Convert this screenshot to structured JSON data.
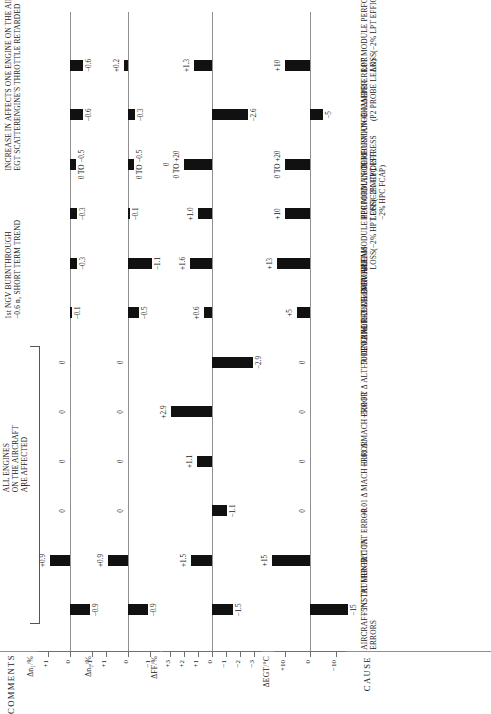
{
  "figure": {
    "comments_header": "COMMENTS",
    "cause_header": "CAUSE"
  },
  "groups": [
    {
      "title": "AIRCRAFT INSTRUMENTATION\nERRORS"
    },
    {
      "title": "ENGINE RELATED PROBLEMS"
    }
  ],
  "panels": [
    {
      "name": "egt",
      "title": "ΔEGT/°C",
      "ticks": [
        "+10",
        "0",
        "−10"
      ],
      "tickvals": [
        10,
        0,
        -10
      ],
      "lim": [
        -14,
        14
      ]
    },
    {
      "name": "ff",
      "title": "ΔFF/%",
      "ticks": [
        "+3",
        "+2",
        "+1",
        "0",
        "−1",
        "−2",
        "−3"
      ],
      "tickvals": [
        3,
        2,
        1,
        0,
        -1,
        -2,
        -3
      ],
      "lim": [
        -3.6,
        3.6
      ]
    },
    {
      "name": "n2",
      "title": "Δn₂/%",
      "ticks": [
        "+1",
        "0",
        "−1"
      ],
      "tickvals": [
        1,
        0,
        -1
      ],
      "lim": [
        -1.45,
        1.45
      ]
    },
    {
      "name": "n1",
      "title": "Δn₁/%",
      "ticks": [
        "+1",
        "0",
        "−1"
      ],
      "tickvals": [
        1,
        0,
        -1
      ],
      "lim": [
        -1.45,
        1.45
      ]
    }
  ],
  "rows": [
    {
      "cause": "+5°C  TAT ERROR",
      "group": 0,
      "egt": {
        "label": "−15",
        "value": -15
      },
      "ff": {
        "label": "−1.5",
        "value": -1.5
      },
      "n2": {
        "label": "−0.9",
        "value": -0.9
      },
      "n1": {
        "label": "−0.9",
        "value": -0.9
      },
      "comment": ""
    },
    {
      "cause": "−5°C  TAT ERROR",
      "group": 0,
      "egt": {
        "label": "+15",
        "value": 15
      },
      "ff": {
        "label": "+1.5",
        "value": 1.5
      },
      "n2": {
        "label": "+0.9",
        "value": 0.9
      },
      "n1": {
        "label": "+0.9",
        "value": 0.9
      },
      "comment": ""
    },
    {
      "cause": "+0.01 Δ MACH ERROR",
      "group": 0,
      "egt": {
        "label": "0",
        "value": 0
      },
      "ff": {
        "label": "−1.1",
        "value": -1.1
      },
      "n2": {
        "label": "0",
        "value": 0
      },
      "n1": {
        "label": "0",
        "value": 0
      },
      "comment": ""
    },
    {
      "cause": "−0.01 Δ MACH ERROR",
      "group": 0,
      "egt": {
        "label": "0",
        "value": 0
      },
      "ff": {
        "label": "+1.1",
        "value": 1.1
      },
      "n2": {
        "label": "0",
        "value": 0
      },
      "n1": {
        "label": "0",
        "value": 0
      },
      "comment": ""
    },
    {
      "cause": "+500  FT Δ ALTITUDE ERROR",
      "group": 0,
      "egt": {
        "label": "0",
        "value": 0
      },
      "ff": {
        "label": "+2.9",
        "value": 2.9
      },
      "n2": {
        "label": "0",
        "value": 0
      },
      "n1": {
        "label": "0",
        "value": 0
      },
      "comment": ""
    },
    {
      "cause": "−500  FT Δ ALTITUDE ERROR",
      "group": 0,
      "egt": {
        "label": "0",
        "value": 0
      },
      "ff": {
        "label": "−2.9",
        "value": -2.9
      },
      "n2": {
        "label": "0",
        "value": 0
      },
      "n1": {
        "label": "0",
        "value": 0
      },
      "comment": ""
    },
    {
      "cause": "+2% 1st NGV AREA",
      "group": 1,
      "egt": {
        "label": "+5",
        "value": 5
      },
      "ff": {
        "label": "+0.6",
        "value": 0.6
      },
      "n2": {
        "label": "−0.5",
        "value": -0.5
      },
      "n1": {
        "label": "−0.1",
        "value": -0.1
      },
      "comment": "1st NGV BURNTHROUGH\n−0.6 n₂ SHORT TERM TREND"
    },
    {
      "cause": "HPT MODULE PERFORMANCE\nLOSS(−2% HPT EFFICIENCY)",
      "group": 1,
      "egt": {
        "label": "+13",
        "value": 13
      },
      "ff": {
        "label": "+1.6",
        "value": 1.6
      },
      "n2": {
        "label": "−1.1",
        "value": -1.1
      },
      "n1": {
        "label": "−0.3",
        "value": -0.3
      },
      "comment": ""
    },
    {
      "cause": "HPC MODULE PERFORMANCE\nLOSS(−2% HPC EFF.\n−2% HPC FCAP)",
      "group": 1,
      "egt": {
        "label": "+10",
        "value": 10
      },
      "ff": {
        "label": "+1.0",
        "value": 1.0
      },
      "n2": {
        "label": "−0.1",
        "value": -0.1
      },
      "n1": {
        "label": "−0.3",
        "value": -0.3
      },
      "comment": ""
    },
    {
      "cause": "COMBUSTION CHAMBER\nDISTRESS",
      "group": 1,
      "egt": {
        "label": "0 TO +20",
        "value": 10
      },
      "ff": {
        "label": "0 TO +20",
        "value": 2.0,
        "label2": "0"
      },
      "n2": {
        "label": "0 TO −0.5",
        "value": -0.25
      },
      "n1": {
        "label": "0 TO −0.5",
        "value": -0.25
      },
      "comment": "INCREASE IN\nEGT SCATTER"
    },
    {
      "cause": "+0.02ΔEPR  ERROR\n(P2 PROBE LEAK)",
      "group": 1,
      "egt": {
        "label": "−5",
        "value": -5
      },
      "ff": {
        "label": "−2.6",
        "value": -2.6
      },
      "n2": {
        "label": "−0.3",
        "value": -0.3
      },
      "n1": {
        "label": "−0.6",
        "value": -0.6
      },
      "comment": "AFFECTS ONE ENGINE ON THE AIRCRAFT\nENGINE'S THROTTLE RETARDED"
    },
    {
      "cause": "LPT MODULE PERFORMANCE\nLOSS(−2% LPT EFFICIENCY)",
      "group": 1,
      "egt": {
        "label": "+10",
        "value": 10
      },
      "ff": {
        "label": "+1.3",
        "value": 1.3
      },
      "n2": {
        "label": "+0.2",
        "value": 0.2
      },
      "n1": {
        "label": "−0.6",
        "value": -0.6
      },
      "comment": ""
    }
  ],
  "bracket": {
    "note": "ALL ENGINES\nON THE AIRCRAFT\nARE AFFECTED",
    "from_row": 0,
    "to_row": 5
  },
  "colors": {
    "bar": "#111111",
    "axis": "#6f6f6f",
    "rule": "#8f8f8f"
  }
}
